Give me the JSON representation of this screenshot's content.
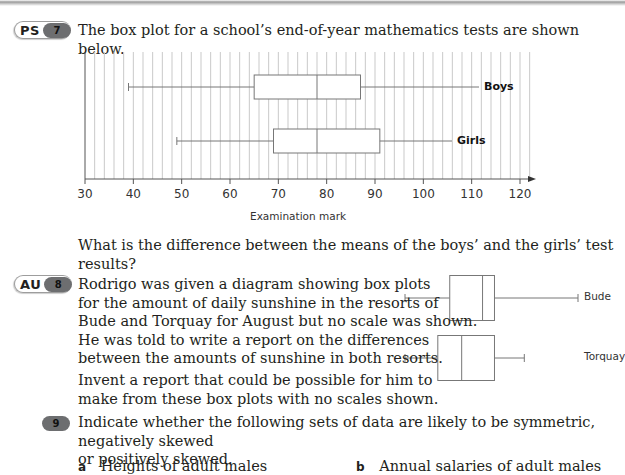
{
  "q7": {
    "tag": "PS",
    "number": "7",
    "prompt": "The box plot for a school’s end-of-year mathematics tests are shown below.",
    "question": "What is the difference between the means of the boys’ and the girls’ test results?"
  },
  "q8": {
    "tag": "AU",
    "number": "8",
    "lines": [
      "Rodrigo was given a diagram showing box plots",
      "for the amount of daily sunshine in the resorts of",
      "Bude and Torquay for August but no scale was shown.",
      "He was told to write a report on the differences",
      "between the amounts of sunshine in both resorts."
    ],
    "lines2": [
      "Invent a report that could be possible for him to",
      "make from these box plots with no scales shown."
    ],
    "labels": {
      "bude": "Bude",
      "torquay": "Torquay"
    }
  },
  "q9": {
    "number": "9",
    "lines": [
      "Indicate whether the following sets of data are likely to be symmetric, negatively skewed",
      "or positively skewed."
    ],
    "parts": [
      {
        "letter": "a",
        "text": "Heights of adult males"
      },
      {
        "letter": "b",
        "text": "Annual salaries of adult males"
      }
    ]
  },
  "chart_data": [
    {
      "type": "box",
      "title": "",
      "xlabel": "Examination mark",
      "ylabel": "",
      "xlim": [
        30,
        122
      ],
      "xticks": [
        30,
        40,
        50,
        60,
        70,
        80,
        90,
        100,
        110,
        120
      ],
      "grid": "vertical lines every 2 marks",
      "series": [
        {
          "name": "Boys",
          "min": 39,
          "q1": 65,
          "median": 78,
          "q3": 87,
          "max": 112
        },
        {
          "name": "Girls",
          "min": 49,
          "q1": 69,
          "median": 78,
          "q3": 91,
          "max": 106
        }
      ]
    },
    {
      "type": "box",
      "title": "",
      "xlabel": "",
      "ylabel": "",
      "scale_shown": false,
      "series": [
        {
          "name": "Bude",
          "min": 0,
          "q1": 15,
          "median": 26,
          "q3": 30,
          "max": 58
        },
        {
          "name": "Torquay",
          "min": 0,
          "q1": 11,
          "median": 19,
          "q3": 30,
          "max": 40
        }
      ]
    }
  ]
}
